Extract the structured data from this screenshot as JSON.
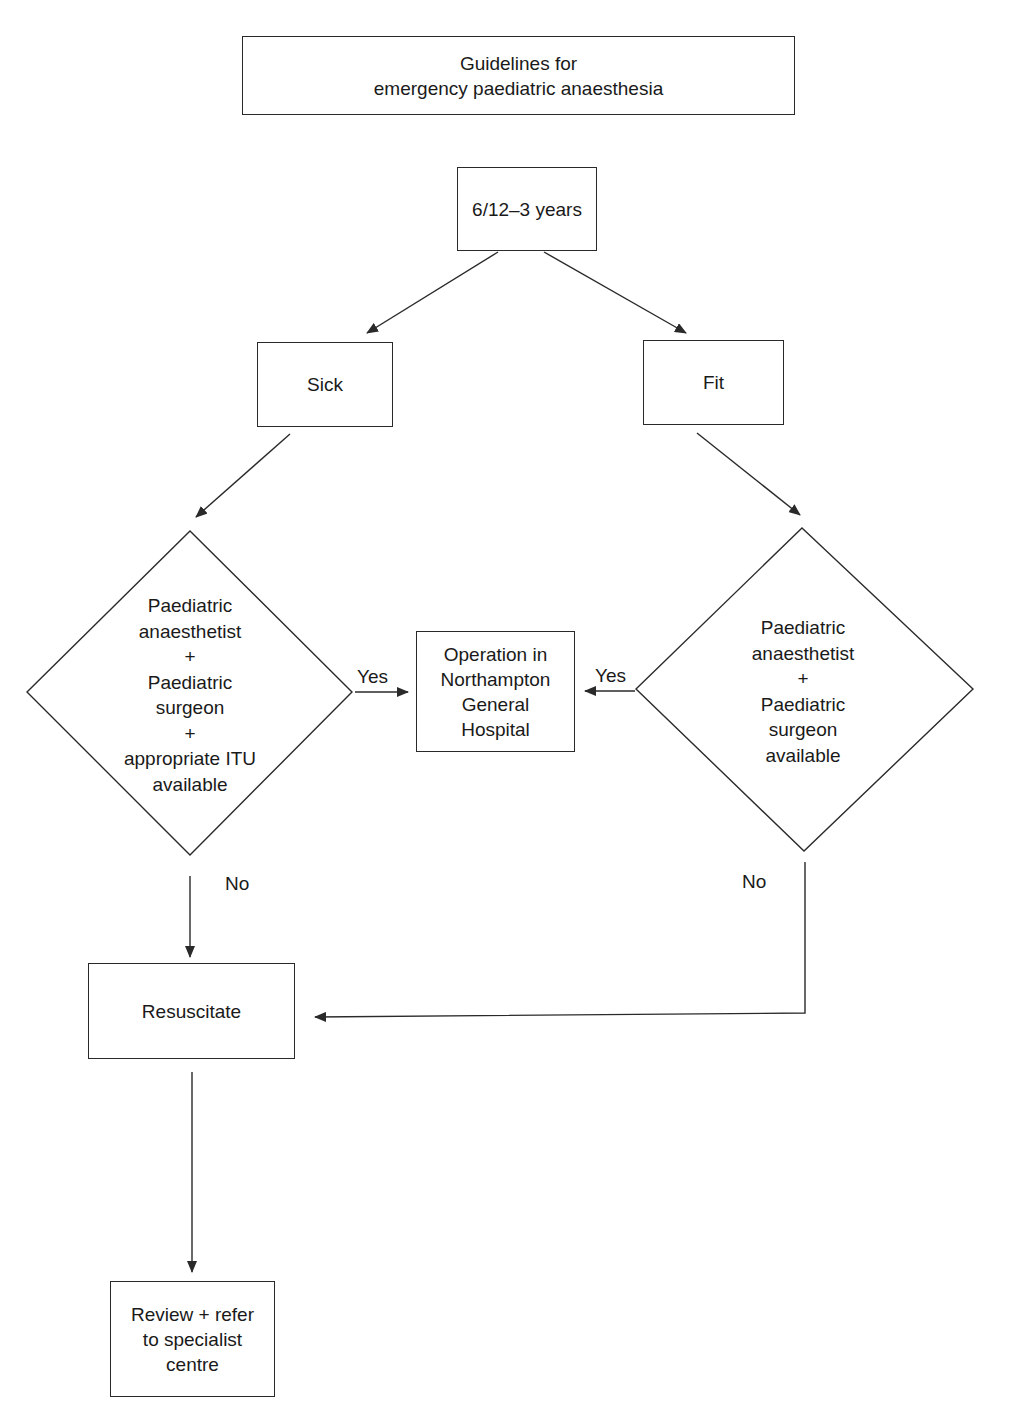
{
  "title": {
    "lines": [
      "Guidelines for",
      "emergency paediatric anaesthesia"
    ]
  },
  "nodes": {
    "age": {
      "label": "6/12–3 years"
    },
    "sick": {
      "label": "Sick"
    },
    "fit": {
      "label": "Fit"
    },
    "decision_sick": {
      "lines": [
        "Paediatric",
        "anaesthetist",
        "+",
        "Paediatric",
        "surgeon",
        "+",
        "appropriate ITU",
        "available"
      ]
    },
    "decision_fit": {
      "lines": [
        "Paediatric",
        "anaesthetist",
        "+",
        "Paediatric",
        "surgeon",
        "available"
      ]
    },
    "operation": {
      "lines": [
        "Operation in",
        "Northampton",
        "General",
        "Hospital"
      ]
    },
    "resuscitate": {
      "label": "Resuscitate"
    },
    "review": {
      "lines": [
        "Review + refer",
        "to specialist",
        "centre"
      ]
    }
  },
  "edge_labels": {
    "sick_yes": "Yes",
    "fit_yes": "Yes",
    "sick_no": "No",
    "fit_no": "No"
  },
  "colors": {
    "line": "#2a2a2a",
    "background": "#ffffff"
  }
}
